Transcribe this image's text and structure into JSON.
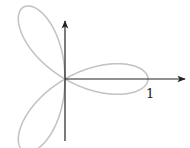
{
  "diagram": {
    "type": "polar-rose",
    "equation": "r = cos 3θ",
    "petals": 3,
    "colors": {
      "curve": "#c4c4c4",
      "axes": "#222222",
      "background": "#ffffff"
    },
    "labels": {
      "x_tick": "1"
    }
  },
  "chart_data": {
    "type": "line",
    "title": "",
    "xlabel": "",
    "ylabel": "",
    "polar_function": "r = cos(3θ)",
    "theta_range": [
      0,
      3.14159
    ],
    "annotations": [
      {
        "text": "1",
        "position": "x-axis at r=1"
      }
    ],
    "origin_px": [
      65,
      79
    ],
    "scale_px_per_unit": 83,
    "grid": false,
    "legend": false
  }
}
